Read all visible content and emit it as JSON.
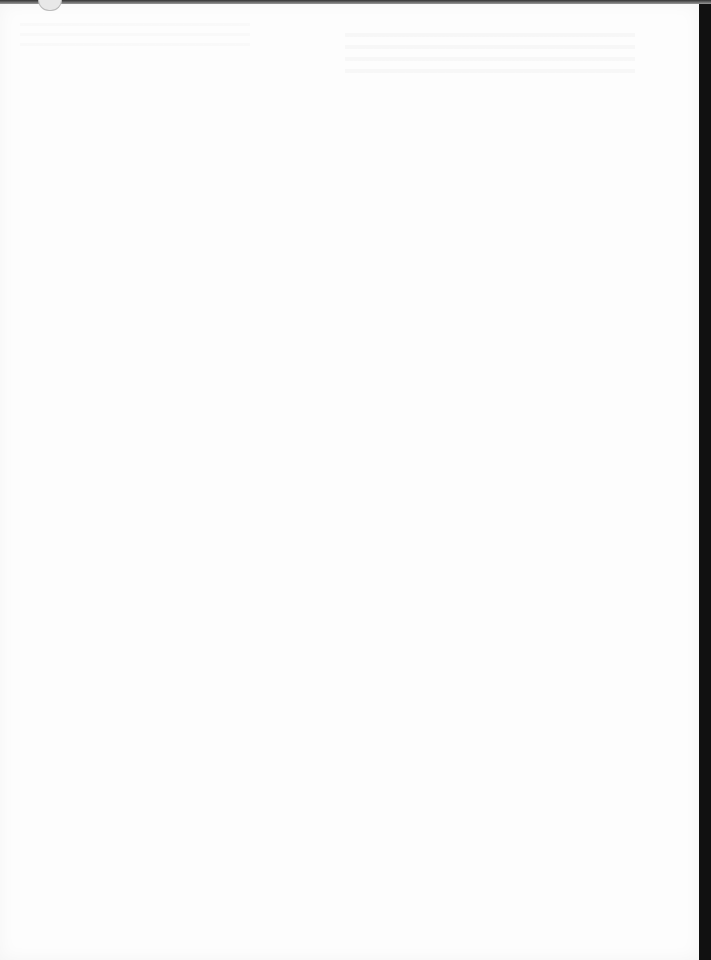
{
  "document": {
    "type": "blank-scanned-page",
    "page_number": "",
    "content": ""
  }
}
